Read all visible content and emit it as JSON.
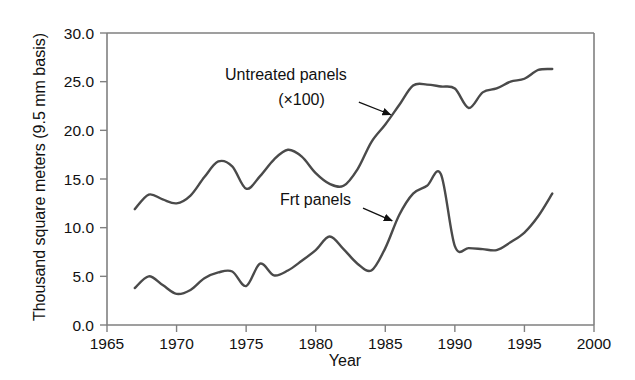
{
  "chart_data": {
    "type": "line",
    "title": "",
    "xlabel": "Year",
    "ylabel": "Thousand square meters (9.5 mm basis)",
    "xlim": [
      1965,
      2000
    ],
    "ylim": [
      0.0,
      30.0
    ],
    "xticks": [
      "1965",
      "1970",
      "1975",
      "1980",
      "1985",
      "1990",
      "1995",
      "2000"
    ],
    "xtick_values": [
      1965,
      1970,
      1975,
      1980,
      1985,
      1990,
      1995,
      2000
    ],
    "yticks": [
      "0.0",
      "5.0",
      "10.0",
      "15.0",
      "20.0",
      "25.0",
      "30.0"
    ],
    "ytick_values": [
      0.0,
      5.0,
      10.0,
      15.0,
      20.0,
      25.0,
      30.0
    ],
    "grid": false,
    "legend_position": "inline-annotations",
    "line_color": "#4a4a4a",
    "axis_color": "#808080",
    "series": [
      {
        "name": "Untreated panels (×100)",
        "annotation": "Untreated panels",
        "annotation_sub": "(×100)",
        "x": [
          1967,
          1968,
          1969,
          1970,
          1971,
          1972,
          1973,
          1974,
          1975,
          1976,
          1977,
          1978,
          1979,
          1980,
          1981,
          1982,
          1983,
          1984,
          1985,
          1986,
          1987,
          1988,
          1989,
          1990,
          1991,
          1992,
          1993,
          1994,
          1995,
          1996,
          1997
        ],
        "values": [
          11.9,
          13.4,
          12.9,
          12.5,
          13.3,
          15.2,
          16.8,
          16.3,
          14.0,
          15.3,
          17.0,
          18.0,
          17.3,
          15.6,
          14.5,
          14.3,
          16.0,
          18.8,
          20.6,
          22.6,
          24.6,
          24.7,
          24.5,
          24.3,
          22.3,
          23.9,
          24.3,
          25.0,
          25.3,
          26.2,
          26.3
        ]
      },
      {
        "name": "Frt panels",
        "annotation": "Frt panels",
        "annotation_sub": "",
        "x": [
          1967,
          1968,
          1969,
          1970,
          1971,
          1972,
          1973,
          1974,
          1975,
          1976,
          1977,
          1978,
          1979,
          1980,
          1981,
          1982,
          1983,
          1984,
          1985,
          1986,
          1987,
          1988,
          1989,
          1990,
          1991,
          1992,
          1993,
          1994,
          1995,
          1996,
          1997
        ],
        "values": [
          3.8,
          5.0,
          4.1,
          3.2,
          3.6,
          4.8,
          5.4,
          5.5,
          4.0,
          6.3,
          5.1,
          5.6,
          6.6,
          7.7,
          9.1,
          7.8,
          6.3,
          5.6,
          7.9,
          11.3,
          13.5,
          14.3,
          15.5,
          8.1,
          7.9,
          7.8,
          7.7,
          8.5,
          9.5,
          11.2,
          13.5
        ]
      }
    ],
    "annotations": [
      {
        "label": "Untreated panels",
        "sublabel": "(×100)",
        "arrow_from_x": 1983.1,
        "arrow_from_y": 22.9,
        "arrow_to_x": 1985.4,
        "arrow_to_y": 21.6
      },
      {
        "label": "Frt panels",
        "sublabel": "",
        "arrow_from_x": 1983.4,
        "arrow_from_y": 12.0,
        "arrow_to_x": 1985.5,
        "arrow_to_y": 10.7
      }
    ]
  }
}
